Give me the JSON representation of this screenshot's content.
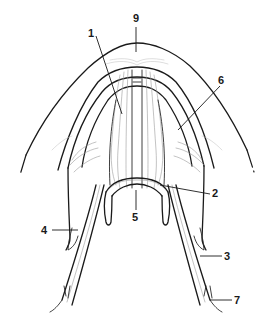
{
  "diagram": {
    "line_color": "#1a1a1a",
    "fiber_color": "#9a9a9a",
    "background": "#ffffff",
    "labels": [
      {
        "id": "1",
        "text": "1",
        "x": 92,
        "y": 24
      },
      {
        "id": "9",
        "text": "9",
        "x": 133,
        "y": 13
      },
      {
        "id": "6",
        "text": "6",
        "x": 218,
        "y": 74
      },
      {
        "id": "2",
        "text": "2",
        "x": 212,
        "y": 188
      },
      {
        "id": "5",
        "text": "5",
        "x": 132,
        "y": 208
      },
      {
        "id": "4",
        "text": "4",
        "x": 41,
        "y": 225
      },
      {
        "id": "3",
        "text": "3",
        "x": 224,
        "y": 252
      },
      {
        "id": "7",
        "text": "7",
        "x": 233,
        "y": 296
      }
    ]
  }
}
